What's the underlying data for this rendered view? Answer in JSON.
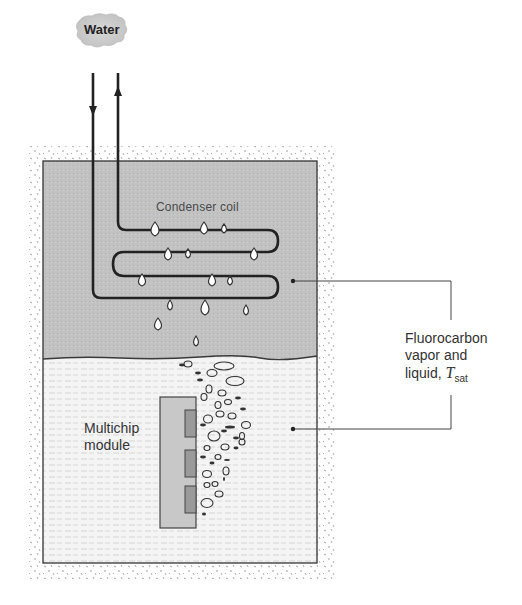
{
  "diagram": {
    "title_fragment": "",
    "water_label": "Water",
    "condenser_label": "Condenser coil",
    "fluid_label": {
      "line1": "Fluorocarbon",
      "line2": "vapor and",
      "line3_prefix": "liquid, ",
      "symbol": "T",
      "subscript": "sat"
    },
    "module_label": {
      "line1": "Multichip",
      "line2": "module"
    },
    "flow": {
      "inlet_arrow": "down",
      "outlet_arrow": "up"
    },
    "colors": {
      "vapor_fill": "#c2c2c2",
      "liquid_fill": "#f4f4f4",
      "module_fill": "#c8c8c8",
      "chip_fill": "#9a9a9a",
      "line": "#2a2a2a",
      "stipple": "#8a8a8a"
    }
  }
}
